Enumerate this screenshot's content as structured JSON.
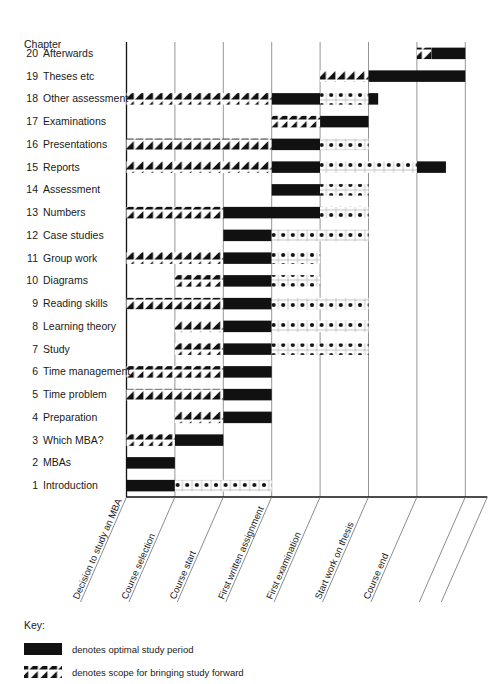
{
  "header": {
    "column_title": "Chapter"
  },
  "chart_data": {
    "type": "bar",
    "title": "",
    "xlabel": "",
    "ylabel": "Chapter",
    "grid": true,
    "legend_position": "bottom-left",
    "milestones": [
      {
        "index": 0,
        "label": "Decision to study an MBA"
      },
      {
        "index": 1,
        "label": "Course selection"
      },
      {
        "index": 2,
        "label": "Course start"
      },
      {
        "index": 3,
        "label": "First written assignment"
      },
      {
        "index": 4,
        "label": "First examination"
      },
      {
        "index": 5,
        "label": "Start work on thesis"
      },
      {
        "index": 6,
        "label": "Course end"
      }
    ],
    "segment_types": [
      "hatch",
      "solid",
      "dots"
    ],
    "x_units": "milestone index (0 = Decision to study an MBA, 6 = Course end, 7 = chart right edge)",
    "categories": [
      "20 Afterwards",
      "19 Theses etc",
      "18 Other assessment",
      "17 Examinations",
      "16 Presentations",
      "15 Reports",
      "14 Assessment",
      "13 Numbers",
      "12 Case studies",
      "11 Group work",
      "10 Diagrams",
      "9 Reading skills",
      "8 Learning theory",
      "7 Study",
      "6 Time management",
      "5 Time problem",
      "4 Preparation",
      "3 Which MBA?",
      "2 MBAs",
      "1 Introduction"
    ],
    "rows": [
      {
        "num": "20",
        "label": "Afterwards",
        "segments": [
          {
            "type": "hatch",
            "start": 6.0,
            "end": 6.3
          },
          {
            "type": "solid",
            "start": 6.3,
            "end": 7.0
          }
        ]
      },
      {
        "num": "19",
        "label": "Theses etc",
        "segments": [
          {
            "type": "hatch",
            "start": 4.0,
            "end": 5.0
          },
          {
            "type": "solid",
            "start": 5.0,
            "end": 7.0
          }
        ]
      },
      {
        "num": "18",
        "label": "Other assessment",
        "segments": [
          {
            "type": "hatch",
            "start": 0.0,
            "end": 3.0
          },
          {
            "type": "solid",
            "start": 3.0,
            "end": 4.0
          },
          {
            "type": "dots",
            "start": 4.0,
            "end": 5.0
          },
          {
            "type": "solid",
            "start": 5.0,
            "end": 5.2
          }
        ]
      },
      {
        "num": "17",
        "label": "Examinations",
        "segments": [
          {
            "type": "hatch",
            "start": 3.0,
            "end": 4.0
          },
          {
            "type": "solid",
            "start": 4.0,
            "end": 5.0
          }
        ]
      },
      {
        "num": "16",
        "label": "Presentations",
        "segments": [
          {
            "type": "hatch",
            "start": 0.0,
            "end": 3.0
          },
          {
            "type": "solid",
            "start": 3.0,
            "end": 4.0
          },
          {
            "type": "dots",
            "start": 4.0,
            "end": 5.0
          }
        ]
      },
      {
        "num": "15",
        "label": "Reports",
        "segments": [
          {
            "type": "hatch",
            "start": 0.0,
            "end": 3.0
          },
          {
            "type": "solid",
            "start": 3.0,
            "end": 4.0
          },
          {
            "type": "dots",
            "start": 4.0,
            "end": 6.0
          },
          {
            "type": "solid",
            "start": 6.0,
            "end": 6.6
          }
        ]
      },
      {
        "num": "14",
        "label": "Assessment",
        "segments": [
          {
            "type": "solid",
            "start": 3.0,
            "end": 4.0
          },
          {
            "type": "dots",
            "start": 4.0,
            "end": 5.0
          }
        ]
      },
      {
        "num": "13",
        "label": "Numbers",
        "segments": [
          {
            "type": "hatch",
            "start": 0.0,
            "end": 2.0
          },
          {
            "type": "solid",
            "start": 2.0,
            "end": 4.0
          },
          {
            "type": "dots",
            "start": 4.0,
            "end": 5.0
          }
        ]
      },
      {
        "num": "12",
        "label": "Case studies",
        "segments": [
          {
            "type": "solid",
            "start": 2.0,
            "end": 3.0
          },
          {
            "type": "dots",
            "start": 3.0,
            "end": 5.0
          }
        ]
      },
      {
        "num": "11",
        "label": "Group work",
        "segments": [
          {
            "type": "hatch",
            "start": 0.0,
            "end": 2.0
          },
          {
            "type": "solid",
            "start": 2.0,
            "end": 3.0
          },
          {
            "type": "dots",
            "start": 3.0,
            "end": 4.0
          }
        ]
      },
      {
        "num": "10",
        "label": "Diagrams",
        "segments": [
          {
            "type": "hatch",
            "start": 1.0,
            "end": 2.0
          },
          {
            "type": "solid",
            "start": 2.0,
            "end": 3.0
          },
          {
            "type": "dots",
            "start": 3.0,
            "end": 4.0
          }
        ]
      },
      {
        "num": "9",
        "label": "Reading skills",
        "segments": [
          {
            "type": "hatch",
            "start": 0.0,
            "end": 2.0
          },
          {
            "type": "solid",
            "start": 2.0,
            "end": 3.0
          },
          {
            "type": "dots",
            "start": 3.0,
            "end": 5.0
          }
        ]
      },
      {
        "num": "8",
        "label": "Learning theory",
        "segments": [
          {
            "type": "hatch",
            "start": 1.0,
            "end": 2.0
          },
          {
            "type": "solid",
            "start": 2.0,
            "end": 3.0
          },
          {
            "type": "dots",
            "start": 3.0,
            "end": 5.0
          }
        ]
      },
      {
        "num": "7",
        "label": "Study",
        "segments": [
          {
            "type": "hatch",
            "start": 1.0,
            "end": 2.0
          },
          {
            "type": "solid",
            "start": 2.0,
            "end": 3.0
          },
          {
            "type": "dots",
            "start": 3.0,
            "end": 5.0
          }
        ]
      },
      {
        "num": "6",
        "label": "Time management",
        "segments": [
          {
            "type": "hatch",
            "start": 0.0,
            "end": 2.0
          },
          {
            "type": "solid",
            "start": 2.0,
            "end": 3.0
          }
        ]
      },
      {
        "num": "5",
        "label": "Time problem",
        "segments": [
          {
            "type": "hatch",
            "start": 0.0,
            "end": 2.0
          },
          {
            "type": "solid",
            "start": 2.0,
            "end": 3.0
          }
        ]
      },
      {
        "num": "4",
        "label": "Preparation",
        "segments": [
          {
            "type": "hatch",
            "start": 1.0,
            "end": 2.0
          },
          {
            "type": "solid",
            "start": 2.0,
            "end": 3.0
          }
        ]
      },
      {
        "num": "3",
        "label": "Which MBA?",
        "segments": [
          {
            "type": "hatch",
            "start": 0.0,
            "end": 1.0
          },
          {
            "type": "solid",
            "start": 1.0,
            "end": 2.0
          }
        ]
      },
      {
        "num": "2",
        "label": "MBAs",
        "segments": [
          {
            "type": "solid",
            "start": 0.0,
            "end": 1.0
          }
        ]
      },
      {
        "num": "1",
        "label": "Introduction",
        "segments": [
          {
            "type": "solid",
            "start": 0.0,
            "end": 1.0
          },
          {
            "type": "dots",
            "start": 1.0,
            "end": 3.0
          }
        ]
      }
    ]
  },
  "key": {
    "title": "Key:",
    "items": [
      {
        "swatch": "solid",
        "text": "denotes optimal study period"
      },
      {
        "swatch": "hatch",
        "text": "denotes scope for bringing study forward"
      }
    ]
  },
  "colors": {
    "ink": "#111111",
    "grid": "#8a8a8a",
    "background": "#ffffff"
  }
}
